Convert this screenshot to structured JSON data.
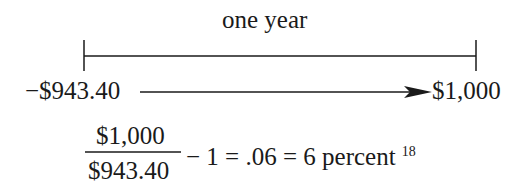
{
  "timeline": {
    "period_label": "one year",
    "start_value": "−$943.40",
    "end_value": "$1,000"
  },
  "equation": {
    "numerator": "$1,000",
    "denominator": "$943.40",
    "rest": "− 1 = .06 = 6 percent",
    "footnote": "18"
  },
  "colors": {
    "ink": "#1a1a1a",
    "background": "#ffffff"
  }
}
